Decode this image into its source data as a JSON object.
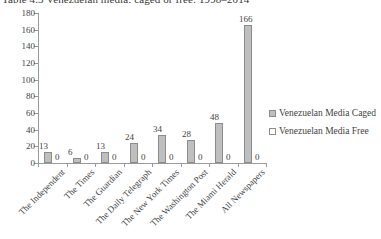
{
  "chart_data": {
    "type": "bar",
    "title": "Table 4.5  Venezuelan media: caged or free: 1998–2014",
    "xlabel": "",
    "ylabel": "",
    "ylim": [
      0,
      180
    ],
    "ytick_step": 20,
    "yticks": [
      180,
      160,
      140,
      120,
      100,
      80,
      60,
      40,
      20,
      0
    ],
    "grid": false,
    "legend_position": "right",
    "categories": [
      "The Independent",
      "The Times",
      "The Guardian",
      "The Daily Telegraph",
      "The New York Times",
      "The Washington Post",
      "The Miami Herald",
      "All Newspapers"
    ],
    "series": [
      {
        "name": "Venezuelan Media Caged",
        "color": "#bfbfbf",
        "values": [
          13,
          6,
          13,
          24,
          34,
          28,
          48,
          166
        ]
      },
      {
        "name": "Venezuelan Media Free",
        "color": "#ffffff",
        "values": [
          0,
          0,
          0,
          0,
          0,
          0,
          0,
          0
        ]
      }
    ]
  },
  "legend": {
    "items": [
      {
        "label": "Venezuelan Media Caged"
      },
      {
        "label": "Venezuelan Media Free"
      }
    ]
  }
}
